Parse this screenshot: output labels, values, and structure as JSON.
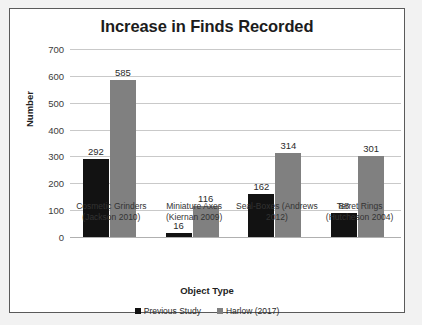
{
  "chart_data": {
    "type": "bar",
    "title": "Increase in Finds Recorded",
    "xlabel": "Object Type",
    "ylabel": "Number",
    "ylim": [
      0,
      700
    ],
    "yticks": [
      700,
      600,
      500,
      400,
      300,
      200,
      100,
      0
    ],
    "grid": true,
    "legend_position": "bottom",
    "categories": [
      "Cosmetic Grinders (Jackson 2010)",
      "Miniature Axes (Kiernan 2009)",
      "Seal-Boxes (Andrews 2012)",
      "Terret Rings (Hutcheson 2004)"
    ],
    "category_lines": [
      [
        "Cosmetic Grinders",
        "(Jackson 2010)"
      ],
      [
        "Miniature Axes",
        "(Kiernan 2009)"
      ],
      [
        "Seal-Boxes (Andrews",
        "2012)"
      ],
      [
        "Terret Rings",
        "(Hutcheson 2004)"
      ]
    ],
    "series": [
      {
        "name": "Previous Study",
        "color": "#121212",
        "values": [
          292,
          16,
          162,
          88
        ]
      },
      {
        "name": "Harlow (2017)",
        "color": "#808080",
        "values": [
          585,
          116,
          314,
          301
        ]
      }
    ]
  }
}
